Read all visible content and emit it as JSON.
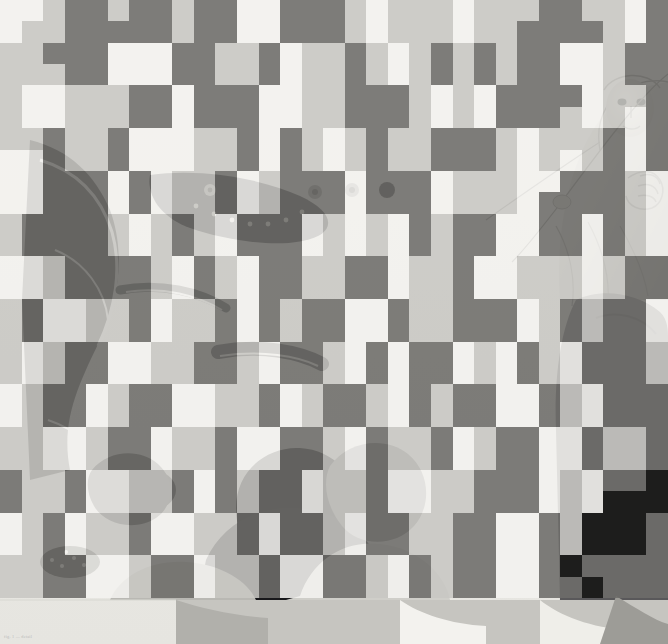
{
  "page": {
    "background_color": "#fdfdfc",
    "width": 668,
    "height": 644
  },
  "caption": {
    "text": "fig. 1 — detail"
  },
  "artwork": {
    "description": "Grayscale classical figure drawing showing a draped figure with a face and a raised hand at upper right, further seated figures in silhouette along the lower portion, and folded drapery with bright highlights at the left.",
    "medium_tone": "#9a9a97",
    "paper_tone": "#f2f1ee",
    "ink_tone": "#1a1a1a"
  },
  "mosaic": {
    "label": "pixelation overlay",
    "columns": 31,
    "rows": 28,
    "cell_width": 21.55,
    "cell_height": 21.35,
    "origin_x": 0,
    "origin_y": 0,
    "opacity": 0.88,
    "palette": {
      "white": "#f4f3f0",
      "light": "#c9c8c4",
      "mid": "#9b9a96",
      "dark": "#6e6d6a",
      "darker": "#454444",
      "black": "#151514"
    },
    "palette_keys": [
      "white",
      "light",
      "mid",
      "dark",
      "darker",
      "black"
    ],
    "cells": [
      "wwlddlddlddwwdddlwlllwlllddllwd",
      "wlldddddlddwwdddlwlllwllddddlwd",
      "lldddwwwddlldwlldlwldldlddwwldd",
      "lllddwwwddlldwlldlwldldlddwwldd",
      "lwwlllddwdddwwlldddlwlwddddwlld",
      "lwwlllddwdddwwlldddlwlwdddlwlwd",
      "lldlldwwwlldwdlwldlldddlwllldwd",
      "wwdlldwwwlldwdlwldlldddlwlwldwd",
      "wwdddwdwlldwldddwdddwlllwwdddlw",
      "wwdddwdwlldwldddwdddwlllwddddlw",
      "lddddlwldlwdddwlwlwdlddwwddwdlw",
      "lddddlwldlwdddwlwlwdlddwwddwdlw",
      "wwlddddlwdlwddllddwlldwwlllwldd",
      "wwlddddlwdlwddllddwlldwwlllwldd",
      "ldwwlldwlldwdlddwwdlldddwldlddw",
      "ldwwlldwlldwdlddwwdlldddwldlddw",
      "lwlddwwllddlwddlwdwddwlwdlwdddl",
      "lwlddwwllddlwddlwdwddwlwdlwdddl",
      "wlddwlddwwlldwlddlwdlddwwdlwddd",
      "wlddwlddwwlldwlddlwdlddwwdlwddd",
      "llwwlddwlldwwddlwdlldwlddwwdlld",
      "llwwlddwlldwwddlwdlldwlddwwdlld",
      "dlldwwlldwdlddwlldwwlldddwlwddb",
      "dlldwwlldwdlddwlldwwlldddwlwbbb",
      "wldwlldwwlldwddlwddllddwwdlbbbd",
      "wldwlldwwlldwddlwddllddwwdlbbbd",
      "llddwwlddwlldwwddlwdlddwwdbdddd",
      "llddwwlddwlldwwddlwdlddwwddbddd"
    ]
  }
}
